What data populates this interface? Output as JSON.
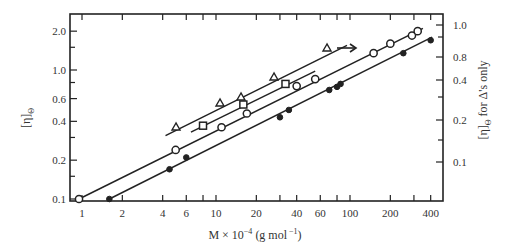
{
  "chart_data": {
    "type": "scatter",
    "title": "",
    "xlabel": "M × 10⁻⁴ (g mol⁻¹)",
    "ylabel": "[η]Θ",
    "y2label": "[η]Θ for Δ's only",
    "xscale": "log",
    "yscale": "log",
    "xlim": [
      0.9,
      450
    ],
    "ylim": [
      0.1,
      2.3
    ],
    "x_ticks": [
      1,
      2,
      4,
      6,
      10,
      20,
      40,
      60,
      100,
      200,
      400
    ],
    "x_tick_labels": [
      "1",
      "2",
      "4",
      "6",
      "10",
      "20",
      "40",
      "60",
      "100",
      "200",
      "400"
    ],
    "y_ticks": [
      0.1,
      0.2,
      0.4,
      0.6,
      1.0,
      2.0
    ],
    "y_tick_labels": [
      "0.1",
      "0.2",
      "0.4",
      "0.6",
      "1.0",
      "2.0"
    ],
    "y2_ticks": [
      0.1,
      0.2,
      0.4,
      0.8,
      1.0
    ],
    "y2_tick_labels": [
      "0.1",
      "0.2",
      "0.4",
      "0.8",
      "1.0"
    ],
    "grid": false,
    "legend": null,
    "annotations": [
      {
        "type": "arrow",
        "text": "→",
        "meaning": "triangles read on right axis"
      }
    ],
    "series": [
      {
        "name": "open circles",
        "marker": "open-circle",
        "axis": "left",
        "x": [
          0.95,
          5,
          11,
          17,
          40,
          55,
          150,
          200,
          290,
          320
        ],
        "y": [
          0.1,
          0.24,
          0.36,
          0.46,
          0.75,
          0.85,
          1.35,
          1.6,
          1.85,
          2.0
        ]
      },
      {
        "name": "filled circles",
        "marker": "filled-circle",
        "axis": "left",
        "x": [
          1.6,
          4.5,
          6,
          30,
          35,
          70,
          80,
          85,
          250,
          400
        ],
        "y": [
          0.1,
          0.17,
          0.21,
          0.43,
          0.49,
          0.7,
          0.74,
          0.78,
          1.35,
          1.7
        ]
      },
      {
        "name": "squares",
        "marker": "open-square",
        "axis": "left",
        "x": [
          8,
          16,
          33
        ],
        "y": [
          0.37,
          0.54,
          0.78
        ]
      },
      {
        "name": "triangles",
        "marker": "open-triangle",
        "axis": "right",
        "x": [
          5,
          11,
          15,
          26,
          65
        ],
        "y": [
          0.19,
          0.27,
          0.29,
          0.38,
          0.56
        ]
      }
    ],
    "fit_lines": [
      {
        "series": "open circles",
        "from": [
          0.95,
          0.1
        ],
        "to": [
          350,
          2.1
        ]
      },
      {
        "series": "filled circles",
        "from": [
          1.6,
          0.1
        ],
        "to": [
          410,
          1.8
        ]
      },
      {
        "series": "squares",
        "from": [
          6.5,
          0.33
        ],
        "to": [
          55,
          0.98
        ]
      },
      {
        "series": "triangles",
        "from": [
          4.2,
          0.31
        ],
        "to": [
          95,
          1.55
        ]
      }
    ]
  },
  "labels": {
    "xlabel_main": "M × 10",
    "xlabel_exp": "−4",
    "xlabel_unit": " (g mol",
    "xlabel_unit_exp": " −1",
    "xlabel_close": ")",
    "ylabel_main": "[η]",
    "ylabel_sub": "Θ",
    "y2label_main": "[η]",
    "y2label_sub": "Θ",
    "y2label_rest": " for Δ's only",
    "arrow": "→"
  }
}
